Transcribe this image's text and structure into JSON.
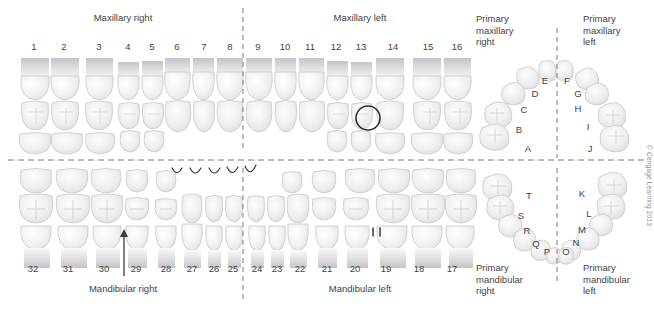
{
  "figure": {
    "copyright": "© Cengage Learning 2013",
    "background_color": "#ffffff",
    "text_color": "#3f3f3f",
    "tooth_fill": "#f4f4f5",
    "tooth_stroke": "#c9c9cc",
    "divider_color": "#7a7a7a",
    "annotation_color": "#2d2d2d"
  },
  "headers": {
    "maxillary_right": "Maxillary right",
    "maxillary_left": "Maxillary left",
    "mandibular_right": "Mandibular right",
    "mandibular_left": "Mandibular left",
    "primary_maxillary_right": "Primary\nmaxillary\nright",
    "primary_maxillary_left": "Primary\nmaxillary\nleft",
    "primary_mandibular_right": "Primary\nmandibular\nright",
    "primary_mandibular_left": "Primary\nmandibular\nleft"
  },
  "permanent": {
    "maxillary": {
      "quadrant_right_numbers": [
        "1",
        "2",
        "3",
        "4",
        "5",
        "6",
        "7",
        "8"
      ],
      "quadrant_left_numbers": [
        "9",
        "10",
        "11",
        "12",
        "13",
        "14",
        "15",
        "16"
      ],
      "numbers": [
        {
          "label": "1",
          "x": 34
        },
        {
          "label": "2",
          "x": 64
        },
        {
          "label": "3",
          "x": 99
        },
        {
          "label": "4",
          "x": 128
        },
        {
          "label": "5",
          "x": 152
        },
        {
          "label": "6",
          "x": 177
        },
        {
          "label": "7",
          "x": 204
        },
        {
          "label": "8",
          "x": 230
        },
        {
          "label": "9",
          "x": 258
        },
        {
          "label": "10",
          "x": 285
        },
        {
          "label": "11",
          "x": 310
        },
        {
          "label": "12",
          "x": 336
        },
        {
          "label": "13",
          "x": 361
        },
        {
          "label": "14",
          "x": 393
        },
        {
          "label": "15",
          "x": 428
        },
        {
          "label": "16",
          "x": 457
        }
      ]
    },
    "mandibular": {
      "quadrant_right_numbers": [
        "32",
        "31",
        "30",
        "29",
        "28",
        "27",
        "26",
        "25"
      ],
      "quadrant_left_numbers": [
        "24",
        "23",
        "22",
        "21",
        "20",
        "19",
        "18",
        "17"
      ],
      "numbers": [
        {
          "label": "32",
          "x": 33
        },
        {
          "label": "31",
          "x": 68
        },
        {
          "label": "30",
          "x": 104
        },
        {
          "label": "29",
          "x": 136
        },
        {
          "label": "28",
          "x": 166
        },
        {
          "label": "27",
          "x": 192
        },
        {
          "label": "26",
          "x": 214
        },
        {
          "label": "25",
          "x": 233
        },
        {
          "label": "24",
          "x": 257
        },
        {
          "label": "23",
          "x": 277
        },
        {
          "label": "22",
          "x": 300
        },
        {
          "label": "21",
          "x": 327
        },
        {
          "label": "20",
          "x": 355
        },
        {
          "label": "19",
          "x": 386
        },
        {
          "label": "18",
          "x": 419
        },
        {
          "label": "17",
          "x": 452
        }
      ]
    }
  },
  "primary": {
    "maxillary": {
      "right_letters": [
        "A",
        "B",
        "C",
        "D",
        "E"
      ],
      "left_letters": [
        "F",
        "G",
        "H",
        "I",
        "J"
      ],
      "letters": [
        {
          "label": "A",
          "x": 528,
          "y": 143
        },
        {
          "label": "B",
          "x": 519,
          "y": 124
        },
        {
          "label": "C",
          "x": 524,
          "y": 104
        },
        {
          "label": "D",
          "x": 535,
          "y": 88
        },
        {
          "label": "E",
          "x": 545,
          "y": 75
        },
        {
          "label": "F",
          "x": 567,
          "y": 75
        },
        {
          "label": "G",
          "x": 578,
          "y": 88
        },
        {
          "label": "H",
          "x": 578,
          "y": 103
        },
        {
          "label": "I",
          "x": 588,
          "y": 121
        },
        {
          "label": "J",
          "x": 590,
          "y": 143
        }
      ]
    },
    "mandibular": {
      "right_letters": [
        "P",
        "Q",
        "R",
        "S",
        "T"
      ],
      "left_letters": [
        "K",
        "L",
        "M",
        "N",
        "O"
      ],
      "letters": [
        {
          "label": "T",
          "x": 529,
          "y": 190
        },
        {
          "label": "S",
          "x": 521,
          "y": 210
        },
        {
          "label": "R",
          "x": 527,
          "y": 225
        },
        {
          "label": "Q",
          "x": 536,
          "y": 238
        },
        {
          "label": "P",
          "x": 547,
          "y": 246
        },
        {
          "label": "O",
          "x": 566,
          "y": 246
        },
        {
          "label": "N",
          "x": 576,
          "y": 237
        },
        {
          "label": "M",
          "x": 582,
          "y": 224
        },
        {
          "label": "L",
          "x": 589,
          "y": 208
        },
        {
          "label": "K",
          "x": 582,
          "y": 188
        }
      ]
    }
  },
  "annotations": {
    "circle_marker": {
      "tooth": "14",
      "shape": "circle-outline",
      "cx": 368,
      "cy": 118,
      "r": 12
    },
    "tick_marker": {
      "tooth": "19",
      "shape": "vertical-ticks",
      "count": 2,
      "x": 375,
      "y": 232
    },
    "pointer_arrow": {
      "target": "29",
      "direction": "up",
      "x": 124,
      "y_top": 230,
      "y_bottom": 276
    },
    "arc_marks": {
      "teeth": [
        "27",
        "26",
        "25",
        "24",
        "23",
        "22"
      ],
      "count": 5,
      "shape": "incisal-arc"
    }
  },
  "dividers": {
    "vertical_midline_x": 243,
    "horizontal_midline_y": 160,
    "primary_vertical_x": 557,
    "style": "dashed"
  }
}
